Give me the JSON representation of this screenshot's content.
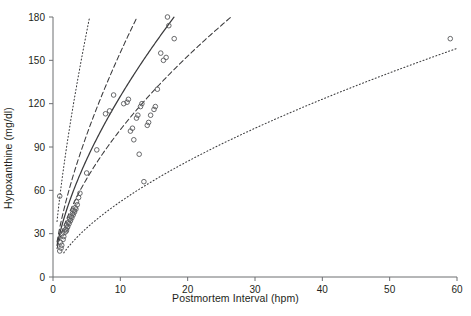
{
  "chart_data": {
    "type": "scatter",
    "title": "",
    "xlabel": "Postmortem Interval (hpm)",
    "ylabel": "Hypoxanthine (mg/dl)",
    "xlim": [
      0,
      60
    ],
    "ylim": [
      0,
      180
    ],
    "xticks": [
      0,
      10,
      20,
      30,
      40,
      50,
      60
    ],
    "yticks": [
      0,
      30,
      60,
      90,
      120,
      150,
      180
    ],
    "grid": false,
    "legend": "none",
    "marker": "open-circle",
    "points": [
      [
        1.0,
        18
      ],
      [
        1.2,
        20
      ],
      [
        1.3,
        22
      ],
      [
        1.1,
        24
      ],
      [
        1.5,
        26
      ],
      [
        1.6,
        28
      ],
      [
        1.4,
        30
      ],
      [
        1.8,
        31
      ],
      [
        2.0,
        32
      ],
      [
        1.9,
        33
      ],
      [
        2.1,
        34
      ],
      [
        2.2,
        35
      ],
      [
        2.0,
        36
      ],
      [
        2.4,
        37
      ],
      [
        2.3,
        38
      ],
      [
        2.6,
        39
      ],
      [
        2.5,
        40
      ],
      [
        2.8,
        41
      ],
      [
        2.7,
        42
      ],
      [
        3.0,
        43
      ],
      [
        2.9,
        44
      ],
      [
        3.2,
        45
      ],
      [
        3.1,
        46
      ],
      [
        3.4,
        47
      ],
      [
        3.3,
        48
      ],
      [
        3.6,
        50
      ],
      [
        3.5,
        52
      ],
      [
        1.0,
        56
      ],
      [
        3.8,
        55
      ],
      [
        4.0,
        58
      ],
      [
        5.0,
        72
      ],
      [
        6.5,
        88
      ],
      [
        7.8,
        113
      ],
      [
        8.4,
        115
      ],
      [
        9.0,
        126
      ],
      [
        10.5,
        120
      ],
      [
        11.0,
        121
      ],
      [
        11.2,
        123
      ],
      [
        11.5,
        101
      ],
      [
        11.8,
        103
      ],
      [
        12.0,
        95
      ],
      [
        12.4,
        110
      ],
      [
        12.6,
        112
      ],
      [
        13.0,
        118
      ],
      [
        13.2,
        120
      ],
      [
        12.8,
        85
      ],
      [
        14.0,
        105
      ],
      [
        14.2,
        107
      ],
      [
        14.5,
        112
      ],
      [
        15.0,
        116
      ],
      [
        15.2,
        118
      ],
      [
        15.5,
        130
      ],
      [
        16.0,
        155
      ],
      [
        16.4,
        150
      ],
      [
        16.8,
        152
      ],
      [
        17.0,
        180
      ],
      [
        17.2,
        174
      ],
      [
        18.0,
        165
      ],
      [
        13.5,
        66
      ],
      [
        59.0,
        165
      ]
    ],
    "curves": [
      {
        "name": "regression-line",
        "style": "solid",
        "description": "fitted regression curve",
        "xrange": [
          0.6,
          29.0
        ],
        "coef_a": 30.0,
        "coef_b": 0.62
      },
      {
        "name": "confidence-band-upper",
        "style": "dashed",
        "xrange": [
          0.6,
          24.0
        ],
        "coef_a": 34.0,
        "coef_b": 0.66
      },
      {
        "name": "confidence-band-lower",
        "style": "dashed",
        "xrange": [
          0.6,
          36.0
        ],
        "coef_a": 26.5,
        "coef_b": 0.585
      },
      {
        "name": "prediction-band-upper",
        "style": "dotted",
        "xrange": [
          0.6,
          12.2
        ],
        "coef_a": 55.0,
        "coef_b": 0.7
      },
      {
        "name": "prediction-band-lower",
        "style": "dotted",
        "xrange": [
          1.6,
          60.0
        ],
        "coef_a": 12.5,
        "coef_b": 0.62
      }
    ]
  },
  "axes": {
    "x": {
      "label": "Postmortem Interval (hpm)",
      "ticklabels": [
        "0",
        "10",
        "20",
        "30",
        "40",
        "50",
        "60"
      ]
    },
    "y": {
      "label": "Hypoxanthine (mg/dl)",
      "ticklabels": [
        "0",
        "30",
        "60",
        "90",
        "120",
        "150",
        "180"
      ]
    }
  },
  "style": {
    "axis_color": "#6d6e71",
    "marker_color": "#58595b",
    "curve_color": "#3b3b3d",
    "background": "#ffffff"
  }
}
